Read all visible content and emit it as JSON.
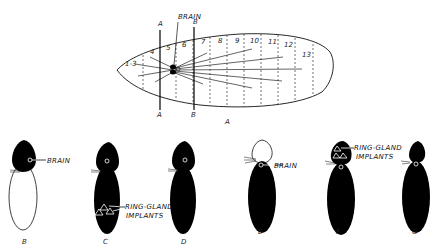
{
  "figure_a": {
    "caption": "A",
    "brain_label": "BRAIN",
    "cut_lines": [
      {
        "top_label": "A",
        "bottom_label": "A"
      },
      {
        "top_label": "B",
        "bottom_label": "B"
      }
    ],
    "segments": [
      "1-3",
      "4",
      "5",
      "6",
      "7",
      "8",
      "9",
      "10",
      "11",
      "12",
      "13"
    ]
  },
  "larvae": [
    {
      "caption": "B",
      "label": "BRAIN"
    },
    {
      "caption": "C",
      "label_line1": "RING-GLAND",
      "label_line2": "IMPLANTS"
    },
    {
      "caption": "D"
    },
    {
      "caption": "E",
      "label": "BRAIN"
    },
    {
      "caption": "F",
      "label_line1": "RING-GLAND",
      "label_line2": "IMPLANTS"
    },
    {
      "caption": "G"
    }
  ],
  "colors": {
    "ink": "#0a0a0a",
    "paper": "#ffffff"
  }
}
